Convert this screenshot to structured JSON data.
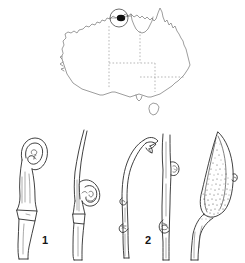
{
  "plate": {
    "kind": "botanical-illustration-plate",
    "background_color": "#ffffff",
    "ink_color": "#2b2b2b"
  },
  "map": {
    "name": "australia-distribution-map",
    "region": "Australia",
    "coastline_color": "#7c7c7c",
    "border_style": "dotted",
    "border_color": "#9a9a9a",
    "locality_marker": {
      "name": "locality-dot",
      "color": "#101010",
      "ring_color": "#4a4a4a",
      "position": "northern-top-end"
    },
    "islands": [
      "Tasmania"
    ],
    "internal_borders": 5
  },
  "figures": [
    {
      "id": "fig-1",
      "label": "1",
      "description": "column with hooded coiled apex",
      "stipple": false
    },
    {
      "id": "fig-2",
      "label": "2",
      "description": "arching column with recurved coiled tip",
      "stipple": false
    },
    {
      "id": "fig-3",
      "label": "3",
      "description": "slender curved column with hooked flared apex",
      "stipple": false
    },
    {
      "id": "fig-5",
      "label": "5",
      "description": "narrow stalk with two lateral calli",
      "stipple": false
    },
    {
      "id": "fig-4",
      "label": "4",
      "description": "stippled lanceolate labellum on curved claw",
      "stipple": true
    }
  ]
}
